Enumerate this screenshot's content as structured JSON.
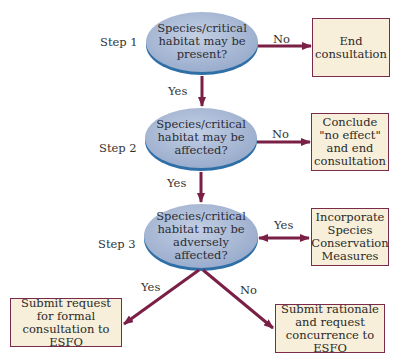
{
  "diagram": {
    "steps": [
      {
        "label": "Step 1",
        "question": "Species/critical habitat may be present?"
      },
      {
        "label": "Step 2",
        "question": "Species/critical habitat may be affected?"
      },
      {
        "label": "Step 3",
        "question": "Species/critical habitat may be adversely affected?"
      }
    ],
    "outcomes": {
      "end_consultation": "End consultation",
      "no_effect": "Conclude \"no effect\" and end consultation",
      "conservation_measures": "Incorporate Species Conservation Measures",
      "formal_consultation": "Submit request for formal consultation to ESFO",
      "request_concurrence": "Submit rationale and request concurrence to ESFO"
    },
    "edge_labels": {
      "s1_no": "No",
      "s1_yes": "Yes",
      "s2_no": "No",
      "s2_yes": "Yes",
      "s3_yes_right": "Yes",
      "s3_yes_down": "Yes",
      "s3_no": "No"
    },
    "colors": {
      "oval_fill": "#a9b9d6",
      "oval_shadow": "#2f6fa8",
      "box_fill": "#f7efd9",
      "box_border": "#7a2a4a",
      "arrow": "#7a1f45"
    }
  }
}
